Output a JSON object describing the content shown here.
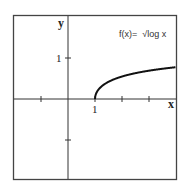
{
  "chart_data": {
    "type": "line",
    "title": "",
    "function_label": "f(x)=  √log x",
    "xlabel": "x",
    "ylabel": "y",
    "x_tick_label": "1",
    "y_tick_label": "1",
    "x_ticks": [
      -1,
      0,
      1,
      2,
      3
    ],
    "y_ticks": [
      -1,
      0,
      1
    ],
    "xlim": [
      -2,
      4
    ],
    "ylim": [
      -2,
      2
    ],
    "grid": false,
    "series": [
      {
        "name": "f(x) = sqrt(log x)",
        "x": [
          1,
          1.01,
          1.05,
          1.1,
          1.25,
          1.5,
          2,
          2.5,
          3,
          3.5,
          4
        ],
        "y": [
          0,
          0.066,
          0.146,
          0.204,
          0.312,
          0.421,
          0.549,
          0.629,
          0.691,
          0.737,
          0.776
        ]
      }
    ]
  },
  "colors": {
    "axis": "#333333",
    "curve": "#111111",
    "frame": "#444444"
  }
}
